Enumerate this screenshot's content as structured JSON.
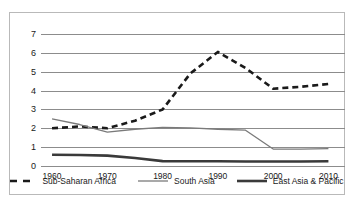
{
  "chart_data": {
    "type": "line",
    "title": "",
    "xlabel": "",
    "ylabel": "",
    "xlim": [
      1958,
      2013
    ],
    "ylim": [
      0,
      7
    ],
    "yticks": [
      0,
      1,
      2,
      3,
      4,
      5,
      6,
      7
    ],
    "xticks": [
      1960,
      1970,
      1980,
      1990,
      2000,
      2010
    ],
    "grid": "horizontal",
    "legend_position": "bottom",
    "series": [
      {
        "name": "Sub-Saharan Africa",
        "style": "dashed",
        "color": "#1a1a1a",
        "x": [
          1960,
          1965,
          1970,
          1975,
          1980,
          1985,
          1990,
          1995,
          2000,
          2005,
          2010
        ],
        "values": [
          2.0,
          2.1,
          2.0,
          2.4,
          3.0,
          4.9,
          6.05,
          5.2,
          4.1,
          4.2,
          4.35
        ]
      },
      {
        "name": "South Asia",
        "style": "solid-thin",
        "color": "#7a7a7a",
        "x": [
          1960,
          1965,
          1970,
          1975,
          1980,
          1985,
          1990,
          1995,
          2000,
          2005,
          2010
        ],
        "values": [
          2.5,
          2.2,
          1.8,
          1.95,
          2.05,
          2.02,
          1.95,
          1.9,
          0.9,
          0.9,
          0.92
        ]
      },
      {
        "name": "East Asia & Pacific",
        "style": "solid-thick",
        "color": "#3a3a3a",
        "x": [
          1960,
          1965,
          1970,
          1975,
          1980,
          1985,
          1990,
          1995,
          2000,
          2005,
          2010
        ],
        "values": [
          0.6,
          0.58,
          0.55,
          0.42,
          0.26,
          0.25,
          0.25,
          0.24,
          0.24,
          0.24,
          0.25
        ]
      }
    ]
  },
  "legend": {
    "items": [
      {
        "label": "Sub-Saharan Africa"
      },
      {
        "label": "South Asia"
      },
      {
        "label": "East Asia & Pacific"
      }
    ]
  }
}
